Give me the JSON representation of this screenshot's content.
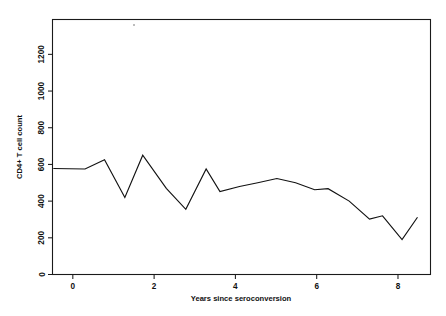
{
  "chart_data": {
    "type": "line",
    "title": "",
    "xlabel": "Years since seroconversion",
    "ylabel": "CD4+ T cell count",
    "xlim": [
      -0.5,
      8.8
    ],
    "ylim": [
      0,
      1390
    ],
    "xticks": [
      0,
      2,
      4,
      6,
      8
    ],
    "xticklabels": [
      "0",
      "2",
      "4",
      "6",
      "8"
    ],
    "yticks": [
      0,
      200,
      400,
      600,
      800,
      1000,
      1200
    ],
    "yticklabels": [
      "0",
      "200",
      "400",
      "600",
      "800",
      "1000",
      "1200"
    ],
    "grid": false,
    "legend": false,
    "series": [
      {
        "name": "CD4+ T cell count",
        "color": "#111111",
        "x": [
          -0.48,
          0.3,
          0.78,
          1.28,
          1.72,
          2.3,
          2.78,
          3.28,
          3.62,
          4.1,
          4.55,
          5.02,
          5.48,
          5.95,
          6.28,
          6.8,
          7.3,
          7.62,
          8.1,
          8.48
        ],
        "y": [
          578,
          575,
          625,
          420,
          650,
          470,
          355,
          575,
          452,
          480,
          500,
          523,
          500,
          462,
          468,
          400,
          302,
          320,
          190,
          312
        ]
      }
    ]
  },
  "axis": {
    "y_label": "CD4+ T cell count",
    "x_label": "Years since seroconversion"
  }
}
